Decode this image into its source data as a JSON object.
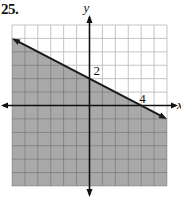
{
  "problem": {
    "number": "25."
  },
  "chart_data": {
    "type": "line",
    "title": "",
    "xlabel": "x",
    "ylabel": "y",
    "xlim": [
      -6,
      6
    ],
    "ylim": [
      -6,
      6
    ],
    "grid": true,
    "grid_step": 1,
    "series": [
      {
        "name": "boundary line",
        "equation": "y = -x/2 + 2",
        "style": "solid",
        "x": [
          -6,
          6
        ],
        "y": [
          5,
          -1
        ]
      }
    ],
    "shaded_region": {
      "description": "below the line",
      "inequality": "y <= -x/2 + 2",
      "color": "#a9a9a9"
    },
    "annotations": [
      {
        "text": "2",
        "x": 0,
        "y": 2,
        "note": "y-intercept label"
      },
      {
        "text": "4",
        "x": 4,
        "y": 0,
        "note": "x-intercept label"
      }
    ]
  },
  "labels": {
    "y_axis": "y",
    "x_axis": "x",
    "y_intercept": "2",
    "x_intercept": "4"
  },
  "colors": {
    "shade": "#a9a9a9",
    "grid_light": "#bdbdbd",
    "grid_dark": "#7a7a7a",
    "line": "#1a1a1a"
  }
}
